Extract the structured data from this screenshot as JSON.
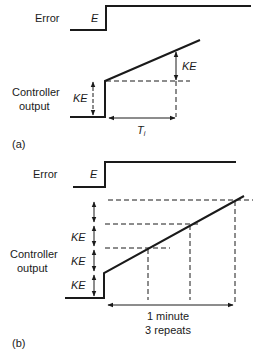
{
  "figure_a": {
    "panel_label": "(a)",
    "error_label": "Error",
    "error_symbol": "E",
    "output_label_line1": "Controller",
    "output_label_line2": "output",
    "proportional_jump_label": "KE",
    "integral_rise_label": "KE",
    "time_label_main": "T",
    "time_label_sub": "i"
  },
  "figure_b": {
    "panel_label": "(b)",
    "error_label": "Error",
    "error_symbol": "E",
    "output_label_line1": "Controller",
    "output_label_line2": "output",
    "step_labels": [
      "KE",
      "KE",
      "KE"
    ],
    "time_label_line1": "1 minute",
    "time_label_line2": "3 repeats"
  },
  "colors": {
    "ink": "#1a1a1a",
    "background": "#ffffff"
  }
}
